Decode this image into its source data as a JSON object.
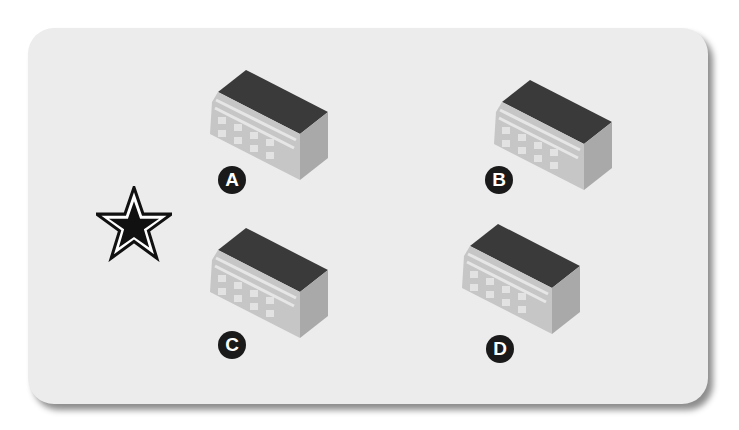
{
  "diagram": {
    "marker": {
      "icon": "star-icon",
      "label": ""
    },
    "options": [
      {
        "id": "A",
        "label": "A"
      },
      {
        "id": "B",
        "label": "B"
      },
      {
        "id": "C",
        "label": "C"
      },
      {
        "id": "D",
        "label": "D"
      }
    ],
    "colors": {
      "card_bg": "#ececec",
      "roof": "#3a3a3a",
      "front": "#c4c4c4",
      "side": "#a8a8a8",
      "badge": "#1a1a1a"
    }
  }
}
